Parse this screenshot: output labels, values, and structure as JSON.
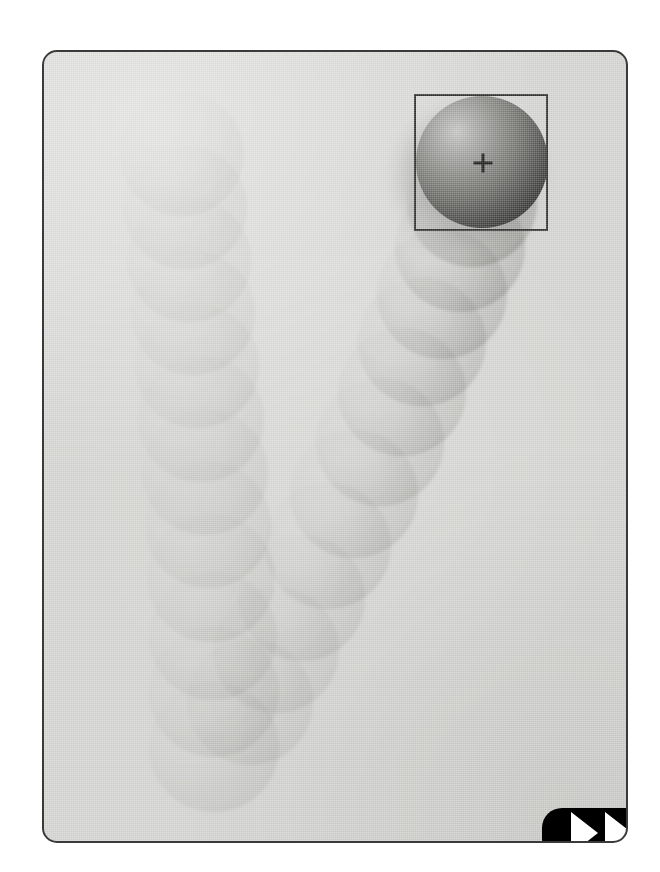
{
  "frame": {
    "label": "video-playback-frame",
    "background_color": "#d4d4d1",
    "border_color": "#3a3a3a",
    "corner_radius_px": 15,
    "x": 42,
    "y": 50,
    "width": 586,
    "height": 793
  },
  "tracked_object": {
    "label": "tracked-sphere",
    "shape": "sphere",
    "center_x": 480,
    "center_y": 160,
    "radius": 66,
    "highlight_color": "#c6c6c4",
    "shadow_color": "#0a0a09"
  },
  "tracker_box": {
    "label": "tracking-bounding-box",
    "x": 412,
    "y": 92,
    "width": 134,
    "height": 137,
    "color": "#31312f",
    "stroke_px": 2
  },
  "crosshair": {
    "label": "centroid-crosshair",
    "center_x": 481,
    "center_y": 161,
    "size": 19,
    "color": "#1b1b1a"
  },
  "controls": {
    "fast_forward": {
      "label": "fast-forward-button",
      "glyph": "fast-forward-icon",
      "triangle_count": 2,
      "background_color": "#000000",
      "glyph_color": "#ffffff",
      "x": 540,
      "y": 806,
      "width": 118,
      "height": 50
    }
  },
  "motion_trail": {
    "label": "motion-trail-ghosts",
    "description": "V-shaped bouncing-ball trajectory rendered as fading ghost spheres",
    "left_arm": [
      {
        "cx": 180,
        "cy": 152,
        "r": 62,
        "opacity": 0.13
      },
      {
        "cx": 183,
        "cy": 205,
        "r": 62,
        "opacity": 0.14
      },
      {
        "cx": 187,
        "cy": 258,
        "r": 62,
        "opacity": 0.15
      },
      {
        "cx": 191,
        "cy": 311,
        "r": 62,
        "opacity": 0.16
      },
      {
        "cx": 195,
        "cy": 364,
        "r": 62,
        "opacity": 0.17
      },
      {
        "cx": 199,
        "cy": 417,
        "r": 63,
        "opacity": 0.18
      },
      {
        "cx": 203,
        "cy": 470,
        "r": 63,
        "opacity": 0.19
      },
      {
        "cx": 206,
        "cy": 523,
        "r": 63,
        "opacity": 0.2
      },
      {
        "cx": 209,
        "cy": 576,
        "r": 64,
        "opacity": 0.21
      },
      {
        "cx": 211,
        "cy": 634,
        "r": 64,
        "opacity": 0.22
      },
      {
        "cx": 212,
        "cy": 690,
        "r": 65,
        "opacity": 0.23
      },
      {
        "cx": 212,
        "cy": 745,
        "r": 65,
        "opacity": 0.24
      }
    ],
    "right_arm": [
      {
        "cx": 248,
        "cy": 700,
        "r": 63,
        "opacity": 0.22
      },
      {
        "cx": 274,
        "cy": 648,
        "r": 63,
        "opacity": 0.24
      },
      {
        "cx": 300,
        "cy": 596,
        "r": 63,
        "opacity": 0.26
      },
      {
        "cx": 326,
        "cy": 544,
        "r": 63,
        "opacity": 0.29
      },
      {
        "cx": 352,
        "cy": 492,
        "r": 64,
        "opacity": 0.32
      },
      {
        "cx": 378,
        "cy": 440,
        "r": 64,
        "opacity": 0.35
      },
      {
        "cx": 400,
        "cy": 390,
        "r": 64,
        "opacity": 0.38
      },
      {
        "cx": 420,
        "cy": 340,
        "r": 64,
        "opacity": 0.42
      },
      {
        "cx": 440,
        "cy": 292,
        "r": 65,
        "opacity": 0.47
      },
      {
        "cx": 458,
        "cy": 245,
        "r": 65,
        "opacity": 0.53
      },
      {
        "cx": 470,
        "cy": 200,
        "r": 65,
        "opacity": 0.6
      }
    ]
  }
}
